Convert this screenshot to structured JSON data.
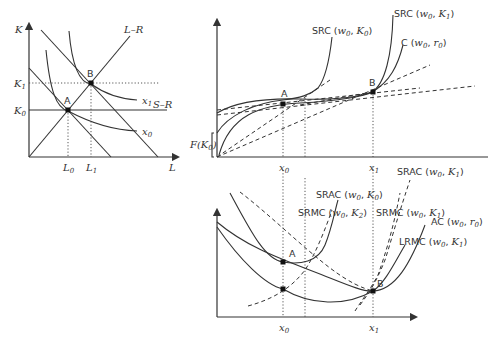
{
  "figure": {
    "panel_isoquant": {
      "axes": {
        "y": "K",
        "x": "L"
      },
      "y_ticks": [
        {
          "base": "K",
          "sub": "1"
        },
        {
          "base": "K",
          "sub": "0"
        }
      ],
      "x_ticks": [
        {
          "base": "L",
          "sub": "0"
        },
        {
          "base": "L",
          "sub": "1"
        }
      ],
      "lines": {
        "long_run": "L–R",
        "short_run": "S–R"
      },
      "isoquants": [
        {
          "base": "x",
          "sub": "1"
        },
        {
          "base": "x",
          "sub": "0"
        }
      ],
      "points": [
        "A",
        "B"
      ]
    },
    "panel_total_cost": {
      "curves": [
        {
          "label": "SRC (",
          "w": "w",
          "wsub": "0",
          "k": "K",
          "ksub": "0"
        },
        {
          "label": "SRC (",
          "w": "w",
          "wsub": "0",
          "k": "K",
          "ksub": "1"
        },
        {
          "label": "C (",
          "w": "w",
          "wsub": "0",
          "k": "r",
          "ksub": "0"
        }
      ],
      "fixed_cost_label": {
        "base": "F(K",
        "sub": "0",
        "close": ")"
      },
      "x_ticks": [
        {
          "base": "x",
          "sub": "0"
        },
        {
          "base": "x",
          "sub": "1"
        }
      ],
      "points": [
        "A",
        "B"
      ]
    },
    "panel_unit_cost": {
      "curves": [
        {
          "label": "SRAC (",
          "w": "w",
          "wsub": "0",
          "k": "K",
          "ksub": "0"
        },
        {
          "label": "SRAC (",
          "w": "w",
          "wsub": "0",
          "k": "K",
          "ksub": "1"
        },
        {
          "label": "SRMC (",
          "w": "w",
          "wsub": "0",
          "k": "K",
          "ksub": "2"
        },
        {
          "label": "SRMC (",
          "w": "w",
          "wsub": "0",
          "k": "K",
          "ksub": "1"
        },
        {
          "label": "AC (",
          "w": "w",
          "wsub": "0",
          "k": "r",
          "ksub": "0"
        },
        {
          "label": "LRMC (",
          "w": "w",
          "wsub": "0",
          "k": "K",
          "ksub": "1"
        }
      ],
      "x_ticks": [
        {
          "base": "x",
          "sub": "0"
        },
        {
          "base": "x",
          "sub": "1"
        }
      ],
      "points": [
        "A",
        "B"
      ]
    }
  }
}
